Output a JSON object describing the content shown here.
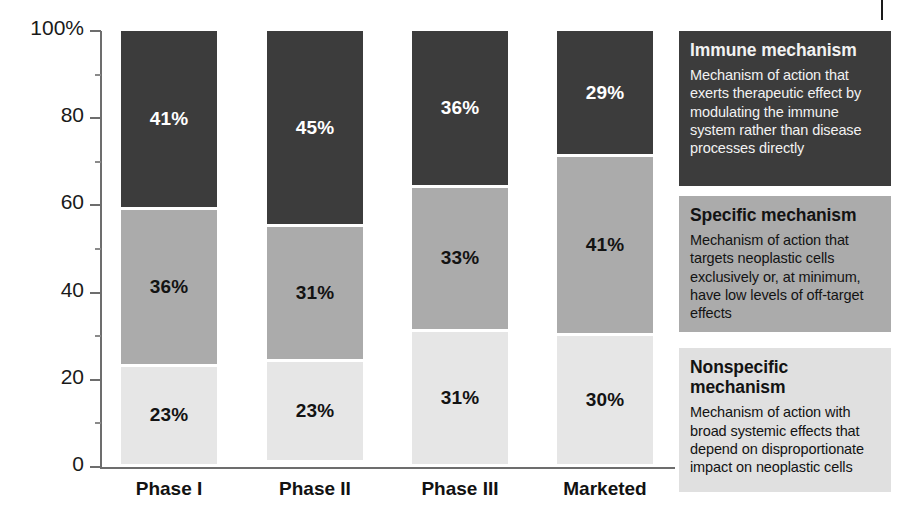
{
  "chart_data": {
    "type": "bar",
    "subtype": "stacked-100-percent",
    "title": "",
    "xlabel": "",
    "ylabel": "",
    "categories": [
      "Phase I",
      "Phase II",
      "Phase III",
      "Marketed"
    ],
    "series": [
      {
        "name": "Immune mechanism",
        "values": [
          41,
          45,
          36,
          29
        ],
        "color": "#3c3c3c"
      },
      {
        "name": "Specific mechanism",
        "values": [
          36,
          31,
          33,
          41
        ],
        "color": "#ababab"
      },
      {
        "name": "Nonspecific mechanism",
        "values": [
          23,
          23,
          31,
          30
        ],
        "color": "#e6e6e6"
      }
    ],
    "stack_order_top_to_bottom": [
      "Immune mechanism",
      "Specific mechanism",
      "Nonspecific mechanism"
    ],
    "data_labels": {
      "Phase I": {
        "Immune mechanism": "41%",
        "Specific mechanism": "36%",
        "Nonspecific mechanism": "23%"
      },
      "Phase II": {
        "Immune mechanism": "45%",
        "Specific mechanism": "31%",
        "Nonspecific mechanism": "23%"
      },
      "Phase III": {
        "Immune mechanism": "36%",
        "Specific mechanism": "33%",
        "Nonspecific mechanism": "31%"
      },
      "Marketed": {
        "Immune mechanism": "29%",
        "Specific mechanism": "41%",
        "Nonspecific mechanism": "30%"
      }
    },
    "ylim": [
      0,
      100
    ],
    "yticks": [
      0,
      20,
      40,
      60,
      80,
      100
    ],
    "ytick_labels": [
      "0",
      "20",
      "40",
      "60",
      "80",
      "100%"
    ],
    "yminor_ticks": [
      10,
      30,
      50,
      70,
      90
    ],
    "grid": false,
    "legend_position": "right"
  },
  "yaxis": {
    "labels": [
      "100%",
      "80",
      "60",
      "40",
      "20",
      "0"
    ]
  },
  "xaxis": {
    "labels": [
      "Phase I",
      "Phase II",
      "Phase III",
      "Marketed"
    ]
  },
  "bars": [
    {
      "category": "Phase I",
      "segments": [
        {
          "key": "immune",
          "label": "41%"
        },
        {
          "key": "specific",
          "label": "36%"
        },
        {
          "key": "nonspec",
          "label": "23%"
        }
      ]
    },
    {
      "category": "Phase II",
      "segments": [
        {
          "key": "immune",
          "label": "45%"
        },
        {
          "key": "specific",
          "label": "31%"
        },
        {
          "key": "nonspec",
          "label": "23%"
        }
      ]
    },
    {
      "category": "Phase III",
      "segments": [
        {
          "key": "immune",
          "label": "36%"
        },
        {
          "key": "specific",
          "label": "33%"
        },
        {
          "key": "nonspec",
          "label": "31%"
        }
      ]
    },
    {
      "category": "Marketed",
      "segments": [
        {
          "key": "immune",
          "label": "29%"
        },
        {
          "key": "specific",
          "label": "41%"
        },
        {
          "key": "nonspec",
          "label": "30%"
        }
      ]
    }
  ],
  "legend": {
    "items": [
      {
        "key": "immune",
        "title": "Immune mechanism",
        "description": "Mechanism of action that exerts therapeutic effect by modulating the immune system rather than disease processes directly",
        "color": "#3c3c3c"
      },
      {
        "key": "specific",
        "title": "Specific mechanism",
        "description": "Mechanism of action that targets neoplastic cells exclusively or, at minimum, have low levels of off-target effects",
        "color": "#ababab"
      },
      {
        "key": "nonspec",
        "title": "Nonspecific mechanism",
        "description": "Mechanism of action with broad systemic effects that depend on disproportionate impact on neoplastic cells",
        "color": "#e0e0e0"
      }
    ]
  }
}
